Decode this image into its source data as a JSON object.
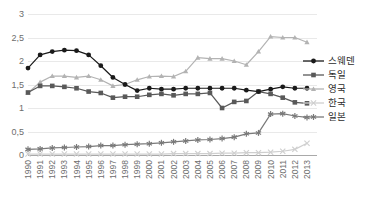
{
  "chart_data": {
    "type": "line",
    "title": "",
    "subtitle": "",
    "xlabel": "",
    "ylabel": "",
    "grid": true,
    "legend_position": "right",
    "ylim": [
      0,
      3
    ],
    "yticks": [
      0,
      0.5,
      1,
      1.5,
      2,
      2.5,
      3
    ],
    "ytick_labels": [
      "0",
      "0,5",
      "1",
      "1,5",
      "2",
      "2,5",
      "3"
    ],
    "decimal_separator": ",",
    "categories": [
      "1990",
      "1991",
      "1992",
      "1993",
      "1994",
      "1995",
      "1996",
      "1997",
      "1998",
      "1999",
      "2000",
      "2001",
      "2002",
      "2003",
      "2004",
      "2005",
      "2006",
      "2007",
      "2008",
      "2009",
      "2010",
      "2011",
      "2012",
      "2013"
    ],
    "series": [
      {
        "name": "스웨덴",
        "name_en": "Sweden",
        "color": "#1a1a1a",
        "marker": "circle",
        "values": [
          1.85,
          2.13,
          2.2,
          2.23,
          2.22,
          2.13,
          1.9,
          1.65,
          1.5,
          1.37,
          1.42,
          1.4,
          1.4,
          1.42,
          1.42,
          1.42,
          1.42,
          1.42,
          1.38,
          1.35,
          1.4,
          1.45,
          1.42,
          1.42
        ]
      },
      {
        "name": "독일",
        "name_en": "Germany",
        "color": "#595959",
        "marker": "square",
        "values": [
          1.33,
          1.47,
          1.47,
          1.45,
          1.42,
          1.35,
          1.32,
          1.22,
          1.24,
          1.24,
          1.28,
          1.3,
          1.27,
          1.3,
          1.3,
          1.32,
          1.0,
          1.13,
          1.15,
          1.35,
          1.3,
          1.22,
          1.12,
          1.1
        ]
      },
      {
        "name": "영국",
        "name_en": "United Kingdom",
        "color": "#b3b3b3",
        "marker": "triangle",
        "values": [
          1.32,
          1.55,
          1.68,
          1.68,
          1.65,
          1.68,
          1.6,
          1.47,
          1.5,
          1.6,
          1.67,
          1.68,
          1.67,
          1.78,
          2.07,
          2.05,
          2.05,
          2.0,
          1.92,
          2.2,
          2.52,
          2.5,
          2.5,
          2.4
        ]
      },
      {
        "name": "한국",
        "name_en": "Korea",
        "color": "#cfcfcf",
        "marker": "x",
        "values": [
          0.02,
          0.02,
          0.02,
          0.02,
          0.02,
          0.02,
          0.02,
          0.02,
          0.02,
          0.02,
          0.02,
          0.02,
          0.03,
          0.03,
          0.03,
          0.03,
          0.04,
          0.04,
          0.05,
          0.05,
          0.06,
          0.08,
          0.12,
          0.25
        ]
      },
      {
        "name": "일본",
        "name_en": "Japan",
        "color": "#7a7a7a",
        "marker": "asterisk",
        "values": [
          0.12,
          0.13,
          0.15,
          0.16,
          0.17,
          0.18,
          0.2,
          0.2,
          0.22,
          0.23,
          0.24,
          0.26,
          0.28,
          0.3,
          0.32,
          0.33,
          0.35,
          0.38,
          0.45,
          0.47,
          0.87,
          0.88,
          0.83,
          0.8
        ]
      }
    ]
  },
  "legend": {
    "items": [
      {
        "label": "스웨덴"
      },
      {
        "label": "독일"
      },
      {
        "label": "영국"
      },
      {
        "label": "한국"
      },
      {
        "label": "일본"
      }
    ]
  },
  "colors": {
    "grid": "#e9e9e9",
    "axis": "#a9a9a9",
    "tick_text": "#6d6d6d",
    "legend_text": "#2b2b2b",
    "background": "#ffffff"
  }
}
